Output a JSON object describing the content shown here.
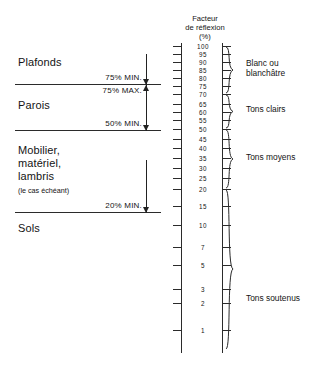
{
  "chart_data": {
    "type": "table",
    "title": "Facteur de réflexion (%)",
    "axis_title_lines": [
      "Facteur",
      "de réflexion",
      "(%)"
    ],
    "ylabel": "Facteur de réflexion (%)",
    "ylim": [
      1,
      100
    ],
    "grid": false,
    "legend_position": "right",
    "tick_labels": [
      "100",
      "95",
      "90",
      "85",
      "80",
      "75",
      "70",
      "65",
      "60",
      "55",
      "50",
      "45",
      "40",
      "35",
      "30",
      "25",
      "20",
      "15",
      "10",
      "7",
      "5",
      "3",
      "2",
      "1"
    ],
    "tick_values": [
      100,
      95,
      90,
      85,
      80,
      75,
      70,
      65,
      60,
      55,
      50,
      45,
      40,
      35,
      30,
      25,
      20,
      15,
      10,
      7,
      5,
      3,
      2,
      1
    ],
    "tick_y": [
      46,
      54,
      62,
      70,
      78,
      86,
      94,
      104,
      112,
      120,
      129,
      139,
      148,
      158,
      168,
      178,
      189,
      206,
      225,
      247,
      265,
      289,
      303,
      330
    ],
    "surfaces": [
      {
        "name": "Plafonds",
        "requirement": "75% MIN.",
        "label_y": 62,
        "divider_y": 84
      },
      {
        "name": "Parois",
        "requirement": "75% MAX.",
        "second_requirement": "50% MIN.",
        "label_y": 105,
        "divider_y": 130
      },
      {
        "name": "Mobilier, matériel, lambris",
        "note": "(le cas échéant)",
        "requirement": "20% MIN.",
        "label_y": 150,
        "divider_y": 212
      },
      {
        "name": "Sols",
        "label_y": 228
      }
    ],
    "annotations": [
      {
        "text": "75% MIN.",
        "y": 77
      },
      {
        "text": "75% MAX.",
        "y": 90
      },
      {
        "text": "50% MIN.",
        "y": 123
      },
      {
        "text": "20% MIN.",
        "y": 205
      }
    ],
    "tone_groups": [
      {
        "label": "Blanc ou blanchâtre",
        "from": 70,
        "to": 100,
        "y_top": 46,
        "y_bottom": 94,
        "label_y": 65
      },
      {
        "label": "Tons clairs",
        "from": 50,
        "to": 70,
        "y_top": 94,
        "y_bottom": 129,
        "label_y": 108
      },
      {
        "label": "Tons moyens",
        "from": 20,
        "to": 50,
        "y_top": 129,
        "y_bottom": 189,
        "label_y": 156
      },
      {
        "label": "Tons soutenus",
        "from": 1,
        "to": 20,
        "y_top": 189,
        "y_bottom": 350,
        "label_y": 297
      }
    ]
  },
  "scale": {
    "title_line1": "Facteur",
    "title_line2": "de réflexion",
    "title_line3": "(%)"
  },
  "left_column": {
    "ceiling_label": "Plafonds",
    "walls_label": "Parois",
    "furniture_label_line1": "Mobilier,",
    "furniture_label_line2": "matériel,",
    "furniture_label_line3": "lambris",
    "furniture_note": "(le cas échéant)",
    "floor_label": "Sols",
    "pct_ceiling_min": "75% MIN.",
    "pct_walls_max": "75% MAX.",
    "pct_walls_min": "50% MIN.",
    "pct_furniture_min": "20% MIN."
  },
  "right_column": {
    "group1": "Blanc ou blanchâtre",
    "group1_line1": "Blanc ou",
    "group1_line2": "blanchâtre",
    "group2": "Tons clairs",
    "group3": "Tons moyens",
    "group4": "Tons soutenus"
  },
  "colors": {
    "ink": "#1a1a1a",
    "rule": "#2b2b2b",
    "background": "#ffffff"
  }
}
